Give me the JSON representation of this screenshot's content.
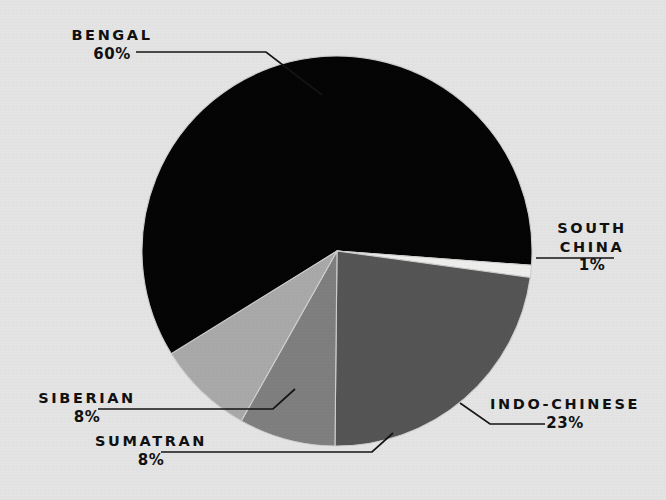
{
  "background_color": "#e4e4e4",
  "text_color": "#111111",
  "chart_data": {
    "type": "pie",
    "title": "",
    "subtitle": "",
    "xlabel": "",
    "ylabel": "",
    "legend_position": "none",
    "grid": false,
    "labels_outside": true,
    "start_angle_deg": -4.2,
    "direction": "counterclockwise",
    "center": {
      "x": 337,
      "y": 251
    },
    "radius": 195,
    "categories": [
      "Bengal",
      "South China",
      "Indo-Chinese",
      "Sumatran",
      "Siberian"
    ],
    "values": [
      60,
      1,
      23,
      8,
      8
    ],
    "unit": "%",
    "slices": [
      {
        "name": "Bengal",
        "label": "BENGAL",
        "value": 60,
        "value_label": "60%",
        "color": "#050505",
        "start_angle_deg": -4.2,
        "end_angle_deg": 212.2,
        "label_x": 62,
        "label_y": 26
      },
      {
        "name": "South China",
        "label": "SOUTH CHINA",
        "label_line1": "SOUTH",
        "label_line2": "CHINA",
        "value": 1,
        "value_label": "1%",
        "color": "#eeeeec",
        "start_angle_deg": -7.8,
        "end_angle_deg": -4.2,
        "label_x": 524,
        "label_y": 219
      },
      {
        "name": "Indo-Chinese",
        "label": "INDO-CHINESE",
        "value": 23,
        "value_label": "23%",
        "color": "#555555",
        "start_angle_deg": -90.6,
        "end_angle_deg": -7.8,
        "label_x": 472,
        "label_y": 395
      },
      {
        "name": "Sumatran",
        "label": "SUMATRAN",
        "value": 8,
        "value_label": "8%",
        "color": "#7f7f7f",
        "start_angle_deg": -119.4,
        "end_angle_deg": -90.6,
        "label_x": 86,
        "label_y": 432
      },
      {
        "name": "Siberian",
        "label": "SIBERIAN",
        "value": 8,
        "value_label": "8%",
        "color": "#a9a9a9",
        "start_angle_deg": -148.2,
        "end_angle_deg": -119.4,
        "label_x": 26,
        "label_y": 389
      }
    ],
    "leader_lines": [
      {
        "for": "Bengal",
        "points": "136,52 266,52 322,95"
      },
      {
        "for": "South China",
        "points": "614,258 536,258"
      },
      {
        "for": "Indo-Chinese",
        "points": "545,424 490,424 460,403"
      },
      {
        "for": "Siberian",
        "points": "98,409 273,409 295,389"
      },
      {
        "for": "Sumatran",
        "points": "161,452 372,452 393,433"
      }
    ]
  }
}
